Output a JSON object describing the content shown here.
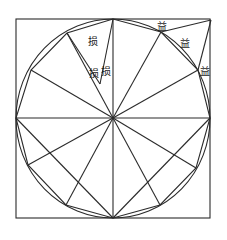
{
  "diagram": {
    "title": "",
    "colors": {
      "stroke": "#2b2b2b",
      "label": "#1a1a1a",
      "background": "#ffffff"
    },
    "labels": {
      "loss_top": "损",
      "loss_mid_left": "损",
      "loss_mid_right": "损",
      "gain_top": "益",
      "gain_mid": "益",
      "gain_right": "益"
    }
  }
}
